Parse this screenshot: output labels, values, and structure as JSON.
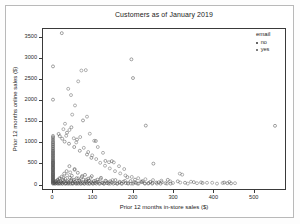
{
  "chart_data": {
    "type": "scatter",
    "title": "Customers as of January 2019",
    "xlabel": "Prior 12 months in-store sales ($)",
    "ylabel": "Prior 12 months online sales ($)",
    "xlim": [
      -25,
      580
    ],
    "ylim": [
      -130,
      3720
    ],
    "xticks": [
      0,
      100,
      200,
      300,
      400,
      500
    ],
    "yticks": [
      0,
      500,
      1000,
      1500,
      2000,
      2500,
      3000,
      3500
    ],
    "grid": false,
    "legend": {
      "title": "email",
      "position": "right-outside",
      "entries": [
        {
          "label": "no",
          "color": "#333333"
        },
        {
          "label": "yes",
          "color": "#555555"
        }
      ]
    },
    "marker": {
      "shape": "circle",
      "size": 1.5,
      "fill": "none",
      "stroke_width": 0.45
    },
    "series": [
      {
        "name": "no",
        "color": "#333333",
        "points": [
          [
            0,
            0
          ],
          [
            0,
            20
          ],
          [
            0,
            45
          ],
          [
            0,
            70
          ],
          [
            0,
            95
          ],
          [
            0,
            120
          ],
          [
            0,
            150
          ],
          [
            0,
            175
          ],
          [
            0,
            205
          ],
          [
            0,
            230
          ],
          [
            0,
            260
          ],
          [
            0,
            290
          ],
          [
            0,
            320
          ],
          [
            0,
            350
          ],
          [
            0,
            380
          ],
          [
            0,
            410
          ],
          [
            0,
            440
          ],
          [
            0,
            470
          ],
          [
            0,
            500
          ],
          [
            0,
            530
          ],
          [
            0,
            560
          ],
          [
            0,
            600
          ],
          [
            0,
            640
          ],
          [
            0,
            680
          ],
          [
            0,
            720
          ],
          [
            0,
            760
          ],
          [
            0,
            800
          ],
          [
            0,
            850
          ],
          [
            0,
            900
          ],
          [
            0,
            950
          ],
          [
            0,
            1000
          ],
          [
            0,
            1060
          ],
          [
            0,
            1120
          ],
          [
            0,
            2020
          ],
          [
            0,
            2820
          ],
          [
            3,
            10
          ],
          [
            5,
            30
          ],
          [
            6,
            0
          ],
          [
            8,
            60
          ],
          [
            9,
            15
          ],
          [
            11,
            0
          ],
          [
            12,
            90
          ],
          [
            13,
            40
          ],
          [
            15,
            5
          ],
          [
            16,
            130
          ],
          [
            18,
            0
          ],
          [
            19,
            55
          ],
          [
            21,
            20
          ],
          [
            22,
            170
          ],
          [
            24,
            0
          ],
          [
            25,
            80
          ],
          [
            27,
            35
          ],
          [
            28,
            240
          ],
          [
            30,
            0
          ],
          [
            31,
            110
          ],
          [
            33,
            10
          ],
          [
            34,
            300
          ],
          [
            36,
            60
          ],
          [
            37,
            0
          ],
          [
            39,
            25
          ],
          [
            41,
            420
          ],
          [
            42,
            140
          ],
          [
            44,
            0
          ],
          [
            45,
            70
          ],
          [
            47,
            190
          ],
          [
            49,
            15
          ],
          [
            50,
            0
          ],
          [
            52,
            90
          ],
          [
            54,
            350
          ],
          [
            55,
            45
          ],
          [
            57,
            0
          ],
          [
            59,
            130
          ],
          [
            61,
            20
          ],
          [
            62,
            260
          ],
          [
            64,
            0
          ],
          [
            66,
            75
          ],
          [
            68,
            40
          ],
          [
            70,
            0
          ],
          [
            72,
            160
          ],
          [
            74,
            10
          ],
          [
            76,
            95
          ],
          [
            78,
            0
          ],
          [
            80,
            210
          ],
          [
            82,
            55
          ],
          [
            84,
            25
          ],
          [
            86,
            0
          ],
          [
            88,
            120
          ],
          [
            90,
            70
          ],
          [
            92,
            0
          ],
          [
            95,
            35
          ],
          [
            97,
            180
          ],
          [
            99,
            0
          ],
          [
            102,
            60
          ],
          [
            105,
            15
          ],
          [
            108,
            0
          ],
          [
            111,
            95
          ],
          [
            114,
            40
          ],
          [
            117,
            0
          ],
          [
            120,
            140
          ],
          [
            124,
            20
          ],
          [
            127,
            0
          ],
          [
            131,
            70
          ],
          [
            135,
            10
          ],
          [
            139,
            0
          ],
          [
            143,
            55
          ],
          [
            147,
            30
          ],
          [
            151,
            0
          ],
          [
            156,
            85
          ],
          [
            161,
            0
          ],
          [
            166,
            25
          ],
          [
            171,
            0
          ],
          [
            176,
            45
          ],
          [
            182,
            10
          ],
          [
            188,
            0
          ],
          [
            194,
            60
          ],
          [
            200,
            0
          ],
          [
            207,
            20
          ],
          [
            214,
            0
          ],
          [
            222,
            35
          ],
          [
            230,
            0
          ],
          [
            239,
            15
          ],
          [
            248,
            0
          ],
          [
            258,
            25
          ],
          [
            269,
            0
          ],
          [
            281,
            10
          ],
          [
            294,
            0
          ],
          [
            22,
            3620
          ],
          [
            196,
            2990
          ],
          [
            232,
            1395
          ],
          [
            251,
            480
          ],
          [
            147,
            540
          ],
          [
            200,
            2540
          ],
          [
            555,
            1390
          ],
          [
            14,
            1195
          ],
          [
            17,
            1140
          ],
          [
            23,
            1080
          ],
          [
            29,
            1010
          ],
          [
            35,
            1225
          ],
          [
            40,
            960
          ],
          [
            46,
            1355
          ],
          [
            53,
            880
          ],
          [
            60,
            1060
          ],
          [
            67,
            790
          ],
          [
            75,
            1520
          ],
          [
            85,
            700
          ],
          [
            96,
            620
          ],
          [
            107,
            1025
          ],
          [
            131,
            545
          ],
          [
            186,
            155
          ],
          [
            205,
            95
          ],
          [
            224,
            60
          ],
          [
            243,
            40
          ],
          [
            264,
            30
          ],
          [
            287,
            90
          ],
          [
            312,
            55
          ],
          [
            330,
            20
          ],
          [
            352,
            35
          ],
          [
            374,
            15
          ],
          [
            428,
            25
          ],
          [
            436,
            10
          ],
          [
            445,
            5
          ]
        ]
      },
      {
        "name": "yes",
        "color": "#555555",
        "points": [
          [
            0,
            5
          ],
          [
            0,
            35
          ],
          [
            0,
            60
          ],
          [
            0,
            85
          ],
          [
            0,
            110
          ],
          [
            0,
            140
          ],
          [
            0,
            165
          ],
          [
            0,
            195
          ],
          [
            0,
            220
          ],
          [
            0,
            250
          ],
          [
            0,
            280
          ],
          [
            0,
            310
          ],
          [
            0,
            340
          ],
          [
            0,
            370
          ],
          [
            0,
            400
          ],
          [
            0,
            430
          ],
          [
            0,
            460
          ],
          [
            0,
            490
          ],
          [
            0,
            520
          ],
          [
            0,
            550
          ],
          [
            0,
            590
          ],
          [
            0,
            630
          ],
          [
            0,
            670
          ],
          [
            0,
            710
          ],
          [
            0,
            750
          ],
          [
            0,
            790
          ],
          [
            0,
            830
          ],
          [
            0,
            880
          ],
          [
            0,
            930
          ],
          [
            0,
            980
          ],
          [
            0,
            1030
          ],
          [
            0,
            1090
          ],
          [
            0,
            1150
          ],
          [
            4,
            0
          ],
          [
            7,
            45
          ],
          [
            10,
            75
          ],
          [
            14,
            0
          ],
          [
            17,
            110
          ],
          [
            20,
            25
          ],
          [
            23,
            0
          ],
          [
            26,
            150
          ],
          [
            29,
            65
          ],
          [
            32,
            0
          ],
          [
            35,
            200
          ],
          [
            38,
            35
          ],
          [
            40,
            0
          ],
          [
            43,
            270
          ],
          [
            46,
            100
          ],
          [
            48,
            0
          ],
          [
            51,
            55
          ],
          [
            54,
            330
          ],
          [
            57,
            15
          ],
          [
            60,
            0
          ],
          [
            63,
            125
          ],
          [
            66,
            75
          ],
          [
            69,
            0
          ],
          [
            73,
            185
          ],
          [
            76,
            30
          ],
          [
            79,
            0
          ],
          [
            83,
            95
          ],
          [
            87,
            50
          ],
          [
            90,
            0
          ],
          [
            94,
            140
          ],
          [
            98,
            20
          ],
          [
            101,
            0
          ],
          [
            106,
            70
          ],
          [
            110,
            35
          ],
          [
            115,
            0
          ],
          [
            119,
            110
          ],
          [
            123,
            15
          ],
          [
            128,
            0
          ],
          [
            133,
            60
          ],
          [
            138,
            25
          ],
          [
            143,
            0
          ],
          [
            149,
            85
          ],
          [
            155,
            10
          ],
          [
            160,
            0
          ],
          [
            167,
            45
          ],
          [
            173,
            0
          ],
          [
            180,
            65
          ],
          [
            187,
            15
          ],
          [
            195,
            0
          ],
          [
            203,
            30
          ],
          [
            211,
            0
          ],
          [
            220,
            50
          ],
          [
            229,
            10
          ],
          [
            238,
            0
          ],
          [
            249,
            20
          ],
          [
            260,
            0
          ],
          [
            272,
            35
          ],
          [
            285,
            0
          ],
          [
            300,
            15
          ],
          [
            318,
            25
          ],
          [
            337,
            0
          ],
          [
            360,
            10
          ],
          [
            385,
            20
          ],
          [
            410,
            0
          ],
          [
            38,
            2280
          ],
          [
            45,
            2130
          ],
          [
            63,
            2460
          ],
          [
            71,
            2720
          ],
          [
            82,
            2730
          ],
          [
            55,
            1880
          ],
          [
            48,
            1660
          ],
          [
            85,
            1610
          ],
          [
            92,
            1200
          ],
          [
            103,
            1030
          ],
          [
            112,
            880
          ],
          [
            125,
            740
          ],
          [
            140,
            515
          ],
          [
            152,
            510
          ],
          [
            178,
            350
          ],
          [
            165,
            420
          ],
          [
            30,
            1440
          ],
          [
            26,
            1310
          ],
          [
            33,
            1150
          ],
          [
            41,
            1290
          ],
          [
            52,
            1090
          ],
          [
            58,
            990
          ],
          [
            68,
            1120
          ],
          [
            77,
            860
          ],
          [
            88,
            760
          ],
          [
            98,
            680
          ],
          [
            108,
            590
          ],
          [
            118,
            500
          ],
          [
            130,
            430
          ],
          [
            142,
            365
          ],
          [
            155,
            300
          ],
          [
            168,
            245
          ],
          [
            181,
            195
          ],
          [
            197,
            160
          ],
          [
            213,
            130
          ],
          [
            231,
            105
          ],
          [
            250,
            85
          ],
          [
            271,
            70
          ],
          [
            293,
            55
          ],
          [
            317,
            240
          ],
          [
            323,
            215
          ],
          [
            345,
            45
          ],
          [
            370,
            30
          ],
          [
            398,
            20
          ],
          [
            424,
            15
          ],
          [
            441,
            40
          ],
          [
            455,
            10
          ]
        ]
      }
    ]
  }
}
